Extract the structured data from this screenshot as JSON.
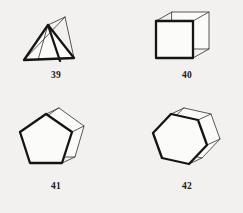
{
  "page": {
    "background_color": "#f2f1ef",
    "bold_edge_color": "#151515",
    "thin_edge_color": "#3b3b3b",
    "face_color": "#fbfbfa",
    "figure_count": 4
  },
  "figures": [
    {
      "id": "39",
      "label": "39",
      "name": "tetrahedron",
      "description": "wireframe tetrahedron with bold front triangular face",
      "bold_face_sides": 3,
      "vertex_count": 4,
      "edge_count": 6
    },
    {
      "id": "40",
      "label": "40",
      "name": "cube",
      "description": "wireframe cube with bold front square face",
      "bold_face_sides": 4,
      "vertex_count": 8,
      "edge_count": 12
    },
    {
      "id": "41",
      "label": "41",
      "name": "pentagonal-prism",
      "description": "wireframe pentagonal prism with bold front pentagonal face",
      "bold_face_sides": 5,
      "vertex_count": 10,
      "edge_count": 15
    },
    {
      "id": "42",
      "label": "42",
      "name": "hexagonal-prism",
      "description": "wireframe hexagonal prism with bold front hexagonal face",
      "bold_face_sides": 6,
      "vertex_count": 12,
      "edge_count": 18
    }
  ]
}
